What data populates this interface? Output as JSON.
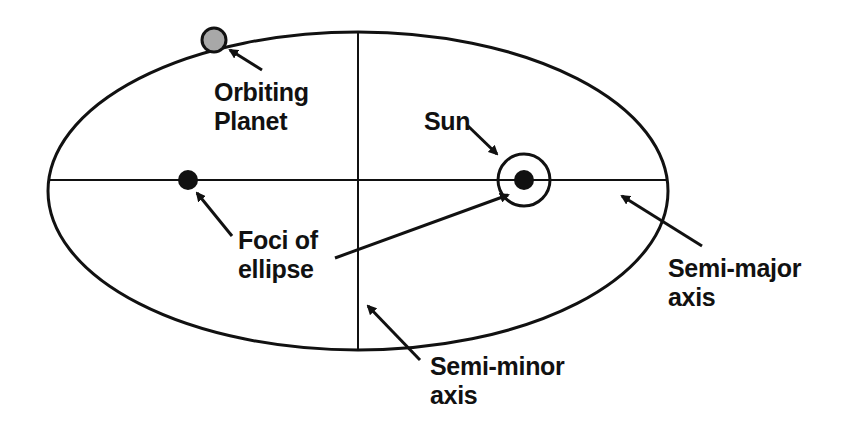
{
  "diagram": {
    "labels": {
      "planet": [
        "Orbiting",
        "Planet"
      ],
      "sun": [
        "Sun"
      ],
      "foci": [
        "Foci of",
        "ellipse"
      ],
      "semi_major": [
        "Semi-major",
        "axis"
      ],
      "semi_minor": [
        "Semi-minor",
        "axis"
      ]
    },
    "colors": {
      "line": "#111111",
      "planet_fill": "#a8a8a8",
      "background": "#ffffff"
    }
  }
}
